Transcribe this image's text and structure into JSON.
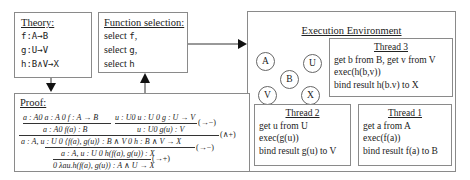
{
  "theory": {
    "title": "Theory:",
    "items": [
      "f:A→B",
      "g:U→V",
      "h:B∧V→X"
    ]
  },
  "function_selection": {
    "title": "Function selection:",
    "items": [
      {
        "prefix": "select ",
        "fn": "f",
        "suffix": ","
      },
      {
        "prefix": "select ",
        "fn": "g",
        "suffix": ","
      },
      {
        "prefix": "select ",
        "fn": "h",
        "suffix": ""
      }
    ]
  },
  "execution_environment": {
    "title": "Execution Environment",
    "nodes": [
      "A",
      "U",
      "B",
      "V",
      "X"
    ],
    "threads": [
      {
        "title": "Thread 3",
        "lines": [
          "get b from B, get v from V",
          "exec(h(b,v))",
          "bind result h(b.v) to X"
        ]
      },
      {
        "title": "Thread 2",
        "lines": [
          "get u from U",
          "exec(g(u))",
          "bind result g(u) to V"
        ]
      },
      {
        "title": "Thread 1",
        "lines": [
          "get a from A",
          "exec(f(a))",
          "bind result f(a) to B"
        ]
      }
    ]
  },
  "proof": {
    "title": "Proof:",
    "lines": {
      "l1a": "a : A0 a : A  0 f : A → B",
      "l1b": "u : U0 u : U  0 g : U → V",
      "l2a": "a : A0 f(a) : B",
      "l2b": "u : U0 g(u) : V",
      "l3": "a : A, u : U 0 ⟨f(a), g(u)⟩ : B ∧ V   0 h : B ∧ V → X",
      "l4": "a : A, u : U 0 h(f(a), g(u)) : X",
      "l5": "0 λau.h(f(a), g(u)) : A ∧ U → X"
    },
    "rules": {
      "r1": "(→−)",
      "r2": "(∧+)",
      "r3": "(→−)",
      "r4": "(→+)"
    }
  }
}
